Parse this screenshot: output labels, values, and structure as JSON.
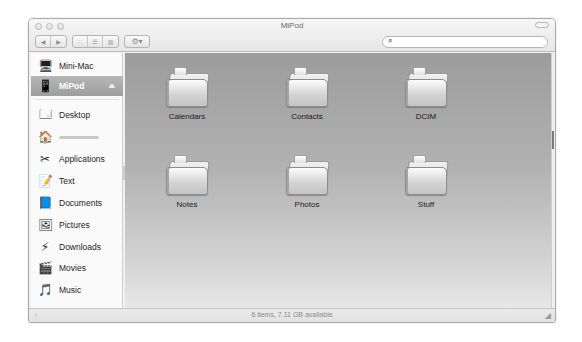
{
  "window": {
    "title": "MiPod",
    "traffic_lights": [
      "close",
      "minimize",
      "zoom"
    ]
  },
  "toolbar": {
    "back_icon": "◀",
    "forward_icon": "▶",
    "view_icons": "∷",
    "view_list": "☰",
    "view_columns": "▥",
    "action_icon": "⚙▾",
    "search": {
      "value": "",
      "placeholder": "",
      "icon": "🔍"
    }
  },
  "sidebar": {
    "devices": [
      {
        "label": "Mini-Mac",
        "icon": "🖥",
        "selected": false
      },
      {
        "label": "MiPod",
        "icon": "📱",
        "selected": true,
        "eject": "⏏"
      }
    ],
    "places": [
      {
        "label": "Desktop",
        "icon": "🗔"
      },
      {
        "label": "",
        "icon": "🏠",
        "blurred": true
      },
      {
        "label": "Applications",
        "icon": "✂"
      },
      {
        "label": "Text",
        "icon": "📝"
      },
      {
        "label": "Documents",
        "icon": "📘"
      },
      {
        "label": "Pictures",
        "icon": "🖼"
      },
      {
        "label": "Downloads",
        "icon": "⚡"
      },
      {
        "label": "Movies",
        "icon": "🎬"
      },
      {
        "label": "Music",
        "icon": "🎵"
      }
    ]
  },
  "content": {
    "folders": [
      {
        "label": "Calendars"
      },
      {
        "label": "Contacts"
      },
      {
        "label": "DCIM"
      },
      {
        "label": "Notes"
      },
      {
        "label": "Photos"
      },
      {
        "label": "Stuff"
      }
    ]
  },
  "statusbar": {
    "text": "6 items, 7.11 GB available",
    "left_grip": "⁞⁞",
    "resize_grip": "◢"
  }
}
